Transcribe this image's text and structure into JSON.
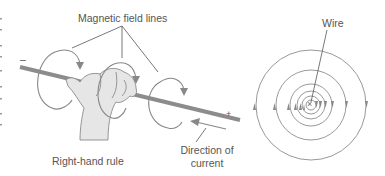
{
  "left_figure": {
    "labels": {
      "field_lines": "Magnetic field lines",
      "rule": "Right-hand rule",
      "direction_line1": "Direction of",
      "direction_line2": "current",
      "minus": "–",
      "plus": "+"
    }
  },
  "right_figure": {
    "labels": {
      "wire": "Wire",
      "center_mark": "×"
    },
    "circle_radii": [
      5,
      9,
      14,
      21,
      35,
      55
    ],
    "arrows_left": "up",
    "arrows_right": "down"
  },
  "colors": {
    "line": "#888888",
    "wire": "#8c8c8c",
    "hand_fill": "#e6e6e6",
    "hand_stroke": "#8a8a8a",
    "text": "#555555",
    "leader": "#555555"
  }
}
